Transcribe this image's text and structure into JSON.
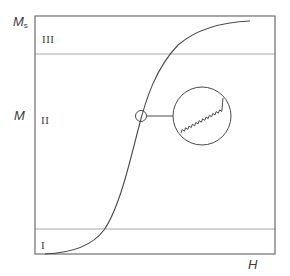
{
  "figure": {
    "y_axis_label": "M",
    "y_axis_max_label_main": "M",
    "y_axis_max_label_sub": "s",
    "x_axis_label": "H",
    "regions": [
      {
        "id": "region-3",
        "label": "III"
      },
      {
        "id": "region-2",
        "label": "II"
      },
      {
        "id": "region-1",
        "label": "I"
      }
    ],
    "inset": {
      "description": "magnified view of curve showing zigzag (spring-like) line"
    },
    "colors": {
      "frame": "#6e6e6e",
      "curve": "#4a4a4a",
      "region_divider": "#a8a8a8",
      "text": "#3a3a3a",
      "background": "#ffffff"
    }
  }
}
